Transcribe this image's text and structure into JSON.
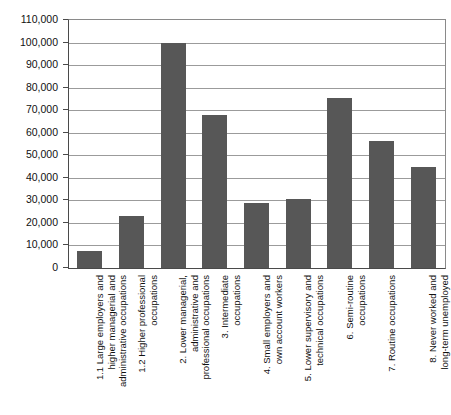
{
  "chart_data": {
    "type": "bar",
    "title": "",
    "subtitle": "",
    "xlabel": "",
    "ylabel": "",
    "ylim": [
      0,
      110000
    ],
    "ytick_step": 10000,
    "grid": true,
    "legend": "none",
    "bar_color": "#575757",
    "categories": [
      "1.1 Large employers and\nhigher managerial and\nadministrative occupations",
      "1.2 Higher professional\noccupations",
      "2. Lower managerial,\nadministrative and\nprofessional occupations",
      "3. Intermediate\noccupations",
      "4. Small employers and\nown account workers",
      "5. Lower supervisory and\ntechnical occupations",
      "6. Semi-routine\noccupations",
      "7. Routine occupations",
      "8. Never worked and\nlong-term unemployed"
    ],
    "values": [
      7500,
      23000,
      100000,
      68000,
      29000,
      30500,
      75500,
      56500,
      45000
    ],
    "ytick_labels": [
      "110,000",
      "100,000",
      "90,000",
      "80,000",
      "70,000",
      "60,000",
      "50,000",
      "40,000",
      "30,000",
      "20,000",
      "10,000",
      "0"
    ],
    "ytick_values": [
      110000,
      100000,
      90000,
      80000,
      70000,
      60000,
      50000,
      40000,
      30000,
      20000,
      10000,
      0
    ]
  }
}
